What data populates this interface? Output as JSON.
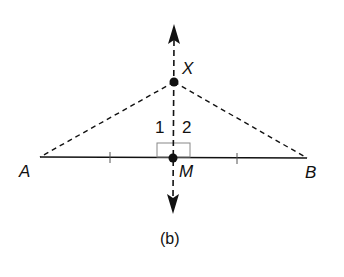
{
  "diagram": {
    "caption": "(b)",
    "points": {
      "A": {
        "label": "A",
        "x": 40,
        "y": 157
      },
      "B": {
        "label": "B",
        "x": 307,
        "y": 158
      },
      "M": {
        "label": "M",
        "x": 173,
        "y": 158
      },
      "X": {
        "label": "X",
        "x": 174,
        "y": 82
      }
    },
    "angles": {
      "angle1": {
        "label": "1"
      },
      "angle2": {
        "label": "2"
      }
    },
    "segments": [
      {
        "from": "A",
        "to": "B",
        "style": "solid"
      },
      {
        "from": "X",
        "to": "A",
        "style": "dashed"
      },
      {
        "from": "X",
        "to": "B",
        "style": "dashed"
      },
      {
        "line": "XM",
        "style": "dashed",
        "arrows": "both"
      }
    ],
    "marks": {
      "congruent_ticks": [
        "AM",
        "MB"
      ],
      "right_angle_at": "M"
    },
    "colors": {
      "ink": "#111111",
      "box": "#888888",
      "background": "#ffffff"
    }
  }
}
